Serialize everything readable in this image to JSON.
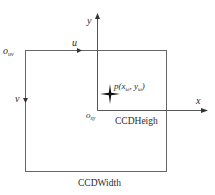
{
  "diagram": {
    "origin_uv": {
      "main": "o",
      "sub": "uv"
    },
    "axis_u": "u",
    "axis_v": "v",
    "axis_x": "x",
    "axis_y": "y",
    "origin_xy": {
      "main": "o",
      "sub": "xy"
    },
    "point": {
      "prefix": "p(x",
      "sub1": "ω",
      "mid": ", y",
      "sub2": "ω",
      "suffix": ")"
    },
    "label_height": "CCDHeigh",
    "label_width": "CCDWidth",
    "colors": {
      "stroke": "#666666",
      "text": "#2a2a2a",
      "marker": "#111111"
    }
  }
}
